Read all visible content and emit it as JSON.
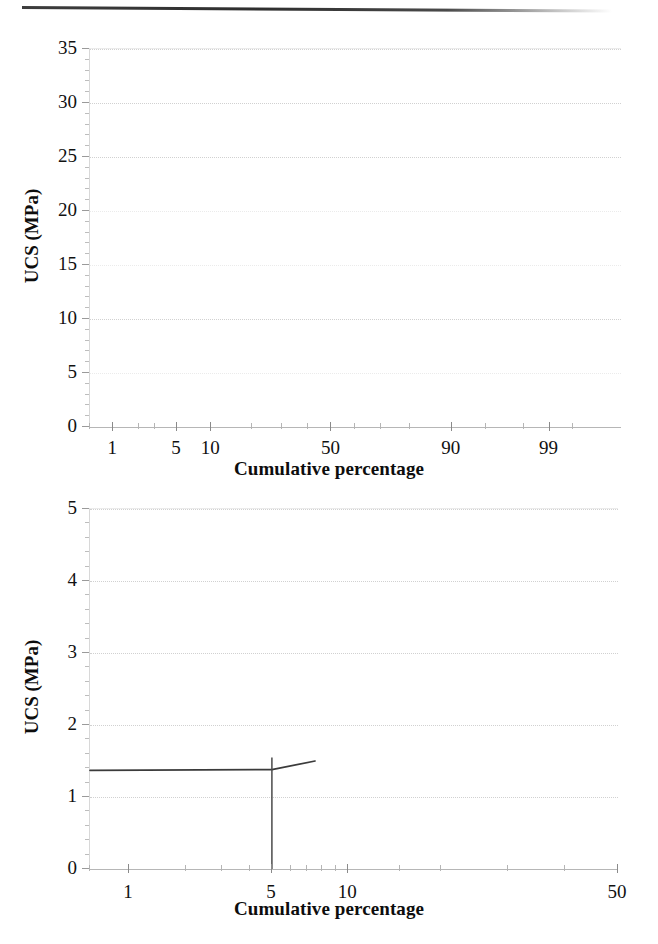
{
  "page": {
    "background": "#ffffff",
    "ink": "#1a1a1a",
    "scan_rule": "scan-artifact-line"
  },
  "figures": [
    {
      "id": "figure-top",
      "axis_title_x": "Cumulative percentage",
      "axis_title_y": "UCS (MPa)"
    },
    {
      "id": "figure-bottom",
      "axis_title_x": "Cumulative percentage",
      "axis_title_y": "UCS (MPa)"
    }
  ],
  "chart_data": [
    {
      "type": "line",
      "title": "",
      "subtitle": "",
      "xlabel": "Cumulative percentage",
      "ylabel": "UCS (MPa)",
      "xscale": "probability",
      "yscale": "linear",
      "ylim": [
        0,
        35
      ],
      "xlim": [
        0.5,
        99.9
      ],
      "grid": true,
      "legend": null,
      "ytick_labels": [
        "0",
        "5",
        "10",
        "15",
        "20",
        "25",
        "30",
        "35"
      ],
      "ytick_values": [
        0,
        5,
        10,
        15,
        20,
        25,
        30,
        35
      ],
      "xtick_labels": [
        "1",
        "5",
        "10",
        "50",
        "90",
        "99"
      ],
      "xtick_values": [
        1,
        5,
        10,
        50,
        90,
        99
      ],
      "xtick_minor_values": [
        0.5,
        2,
        3,
        20,
        30,
        40,
        60,
        70,
        80,
        95,
        98,
        99.5
      ],
      "series": [
        {
          "name": "UCS cumulative distribution",
          "x": [],
          "y": [],
          "note": "no visible data plotted in upper panel"
        }
      ]
    },
    {
      "type": "line",
      "title": "",
      "subtitle": "",
      "xlabel": "Cumulative percentage",
      "ylabel": "UCS (MPa)",
      "xscale": "probability",
      "yscale": "linear",
      "ylim": [
        0,
        5
      ],
      "xlim": [
        0.6,
        50
      ],
      "grid": true,
      "legend": null,
      "ytick_labels": [
        "0",
        "1",
        "2",
        "3",
        "4",
        "5"
      ],
      "ytick_values": [
        0,
        1,
        2,
        3,
        4,
        5
      ],
      "xtick_labels": [
        "1",
        "5",
        "10",
        "50"
      ],
      "xtick_values": [
        1,
        5,
        10,
        50
      ],
      "xtick_minor_values": [
        0.6,
        2,
        3,
        4,
        6,
        7,
        8,
        9,
        15,
        20,
        30,
        40
      ],
      "series": [
        {
          "name": "UCS cumulative distribution",
          "x": [
            0.6,
            5.0,
            7.5
          ],
          "y": [
            1.37,
            1.38,
            1.5
          ]
        },
        {
          "name": "vertical marker at 5%",
          "x": [
            5.0,
            5.0
          ],
          "y": [
            0.0,
            1.55
          ]
        }
      ]
    }
  ],
  "top_chart": {
    "ylabels": [
      "35",
      "30",
      "25",
      "20",
      "15",
      "10",
      "5",
      "0"
    ],
    "xlabels": [
      "1",
      "5",
      "10",
      "50",
      "90",
      "99"
    ],
    "axis_title_x": "Cumulative percentage",
    "axis_title_y": "UCS (MPa)"
  },
  "bottom_chart": {
    "ylabels": [
      "5",
      "4",
      "3",
      "2",
      "1",
      "0"
    ],
    "xlabels": [
      "1",
      "5",
      "10",
      "50"
    ],
    "axis_title_x": "Cumulative percentage",
    "axis_title_y": "UCS (MPa)"
  }
}
